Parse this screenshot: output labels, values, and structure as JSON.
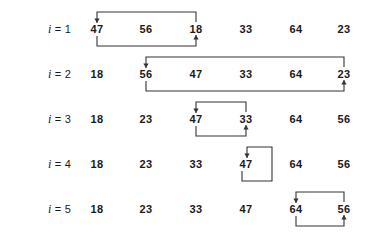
{
  "figure": {
    "kind": "selection-sort-trace",
    "row_label_prefix": "i",
    "row_label_separator": "=",
    "columns": 6,
    "rows": [
      {
        "index": "1",
        "label_value": "1",
        "values": [
          "47",
          "56",
          "18",
          "33",
          "64",
          "23"
        ],
        "swap": {
          "from_col": 1,
          "to_col": 3,
          "style": "wide"
        }
      },
      {
        "index": "2",
        "label_value": "2",
        "values": [
          "18",
          "56",
          "47",
          "33",
          "64",
          "23"
        ],
        "swap": {
          "from_col": 2,
          "to_col": 6,
          "style": "wide"
        }
      },
      {
        "index": "3",
        "label_value": "3",
        "values": [
          "18",
          "23",
          "47",
          "33",
          "64",
          "56"
        ],
        "swap": {
          "from_col": 3,
          "to_col": 4,
          "style": "wide"
        }
      },
      {
        "index": "4",
        "label_value": "4",
        "values": [
          "18",
          "23",
          "33",
          "47",
          "64",
          "56"
        ],
        "swap": {
          "from_col": 4,
          "to_col": 4,
          "style": "self"
        }
      },
      {
        "index": "5",
        "label_value": "5",
        "values": [
          "18",
          "23",
          "33",
          "47",
          "64",
          "56"
        ],
        "swap": {
          "from_col": 5,
          "to_col": 6,
          "style": "wide"
        }
      }
    ]
  },
  "geometry": {
    "label_x": 48,
    "col_x": [
      97,
      146,
      196,
      246,
      296,
      344
    ],
    "row_y": [
      29,
      74,
      119,
      164,
      209
    ],
    "bracket_top_offset": 17,
    "bracket_bottom_offset": 17,
    "self_box_width": 25
  },
  "style": {
    "stroke_color": "#333333",
    "text_color": "#1a1a1a",
    "background": "#ffffff"
  }
}
